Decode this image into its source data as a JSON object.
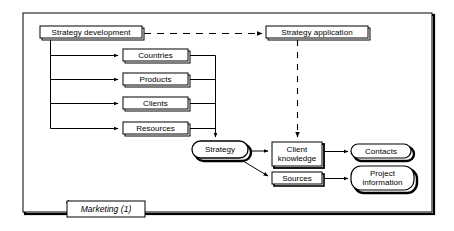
{
  "diagram": {
    "title": "Marketing (1)",
    "type": "process-flow-diagram",
    "colors": {
      "stroke": "#000000",
      "fill": "#ffffff",
      "shadow": "#000000",
      "frame": "#000000"
    },
    "frame": {
      "label": "Marketing (1)",
      "label_style": "italic"
    },
    "nodes": {
      "strategy_development": {
        "label": "Strategy development",
        "shape": "rect"
      },
      "strategy_application": {
        "label": "Strategy application",
        "shape": "rect"
      },
      "countries": {
        "label": "Countries",
        "shape": "rect"
      },
      "products": {
        "label": "Products",
        "shape": "rect"
      },
      "clients": {
        "label": "Clients",
        "shape": "rect"
      },
      "resources": {
        "label": "Resources",
        "shape": "rect"
      },
      "strategy": {
        "label": "Strategy",
        "shape": "rounded"
      },
      "client_knowledge": {
        "label": "Client\nknowledge",
        "shape": "rect"
      },
      "sources": {
        "label": "Sources",
        "shape": "rect"
      },
      "contacts": {
        "label": "Contacts",
        "shape": "rounded"
      },
      "project_information": {
        "label": "Project\ninformation",
        "shape": "rounded"
      }
    },
    "edges": [
      {
        "from": "strategy_development",
        "to": "strategy_application",
        "style": "dashed",
        "arrow": true
      },
      {
        "from": "strategy_development",
        "to": "countries",
        "style": "solid",
        "arrow": true
      },
      {
        "from": "strategy_development",
        "to": "products",
        "style": "solid",
        "arrow": true
      },
      {
        "from": "strategy_development",
        "to": "clients",
        "style": "solid",
        "arrow": true
      },
      {
        "from": "strategy_development",
        "to": "resources",
        "style": "solid",
        "arrow": true
      },
      {
        "from": "countries",
        "to": "strategy",
        "style": "solid",
        "arrow": true
      },
      {
        "from": "products",
        "to": "strategy",
        "style": "solid",
        "arrow": true
      },
      {
        "from": "clients",
        "to": "strategy",
        "style": "solid",
        "arrow": true
      },
      {
        "from": "resources",
        "to": "strategy",
        "style": "solid",
        "arrow": true
      },
      {
        "from": "strategy_application",
        "to": "client_knowledge",
        "style": "dashed",
        "arrow": true
      },
      {
        "from": "strategy",
        "to": "client_knowledge",
        "style": "solid",
        "arrow": true
      },
      {
        "from": "strategy",
        "to": "sources",
        "style": "solid",
        "arrow": true
      },
      {
        "from": "client_knowledge",
        "to": "contacts",
        "style": "solid",
        "arrow": true
      },
      {
        "from": "sources",
        "to": "project_information",
        "style": "solid",
        "arrow": true
      }
    ]
  }
}
